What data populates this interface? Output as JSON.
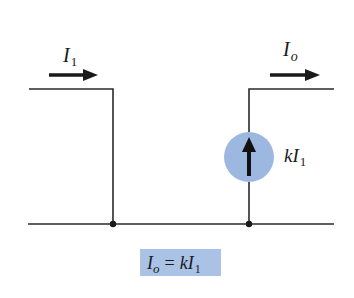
{
  "diagram": {
    "type": "ideal current-controlled current source (CCCS)",
    "colors": {
      "wire": "#2a2a2a",
      "source_fill": "#9db8e0",
      "equation_box": "#a9c2e6",
      "background": "#ffffff"
    },
    "input_current": {
      "symbol": "I",
      "subscript": "1",
      "arrow_direction": "right"
    },
    "output_current": {
      "symbol": "I",
      "subscript": "o",
      "arrow_direction": "right"
    },
    "source": {
      "label_prefix": "k",
      "label_symbol": "I",
      "label_subscript": "1",
      "arrow_direction": "up"
    },
    "equation": {
      "lhs_symbol": "I",
      "lhs_subscript": "o",
      "operator": "=",
      "rhs_prefix": "k",
      "rhs_symbol": "I",
      "rhs_subscript": "1"
    }
  }
}
